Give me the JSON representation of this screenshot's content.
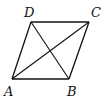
{
  "diagram": {
    "type": "parallelogram-with-diagonals",
    "vertices": [
      {
        "id": "A",
        "label": "A",
        "x": 12,
        "y": 79,
        "label_x": 4,
        "label_y": 96
      },
      {
        "id": "B",
        "label": "B",
        "x": 69,
        "y": 79,
        "label_x": 67,
        "label_y": 96
      },
      {
        "id": "C",
        "label": "C",
        "x": 89,
        "y": 22,
        "label_x": 91,
        "label_y": 17
      },
      {
        "id": "D",
        "label": "D",
        "x": 31,
        "y": 22,
        "label_x": 24,
        "label_y": 17
      }
    ],
    "edges": [
      [
        "A",
        "B"
      ],
      [
        "B",
        "C"
      ],
      [
        "C",
        "D"
      ],
      [
        "D",
        "A"
      ]
    ],
    "diagonals": [
      [
        "A",
        "C"
      ],
      [
        "D",
        "B"
      ]
    ],
    "stroke_color": "#111111",
    "background": "#ffffff"
  }
}
